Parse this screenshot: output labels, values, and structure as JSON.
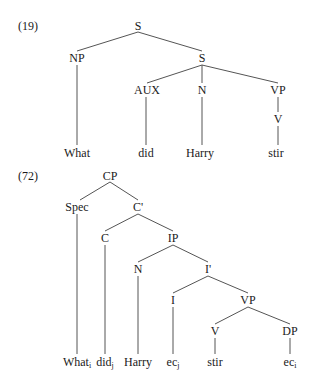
{
  "trees": [
    {
      "number": "(19)",
      "number_pos": [
        18,
        19
      ],
      "nodes": [
        {
          "id": "S1",
          "label": "S",
          "x": 138,
          "y": 26
        },
        {
          "id": "NP",
          "label": "NP",
          "x": 77,
          "y": 58
        },
        {
          "id": "S2",
          "label": "S",
          "x": 202,
          "y": 58
        },
        {
          "id": "AUX",
          "label": "AUX",
          "x": 147,
          "y": 90
        },
        {
          "id": "N",
          "label": "N",
          "x": 202,
          "y": 90
        },
        {
          "id": "VP",
          "label": "VP",
          "x": 278,
          "y": 90
        },
        {
          "id": "V",
          "label": "V",
          "x": 278,
          "y": 119
        },
        {
          "id": "w1",
          "label": "What",
          "x": 77,
          "y": 153
        },
        {
          "id": "w2",
          "label": "did",
          "x": 146,
          "y": 153
        },
        {
          "id": "w3",
          "label": "Harry",
          "x": 200,
          "y": 153
        },
        {
          "id": "w4",
          "label": "stir",
          "x": 276,
          "y": 153
        }
      ],
      "edges": [
        [
          138,
          32,
          77,
          51
        ],
        [
          138,
          32,
          202,
          51
        ],
        [
          77,
          65,
          77,
          145
        ],
        [
          202,
          65,
          147,
          83
        ],
        [
          202,
          65,
          202,
          83
        ],
        [
          202,
          65,
          278,
          83
        ],
        [
          146,
          97,
          146,
          145
        ],
        [
          202,
          97,
          202,
          145
        ],
        [
          278,
          97,
          278,
          112
        ],
        [
          278,
          126,
          278,
          145
        ]
      ]
    },
    {
      "number": "(72)",
      "number_pos": [
        18,
        169
      ],
      "nodes": [
        {
          "id": "CP",
          "label": "CP",
          "x": 110,
          "y": 176
        },
        {
          "id": "Spec",
          "label": "Spec",
          "x": 77,
          "y": 207
        },
        {
          "id": "Cbar",
          "label": "C'",
          "x": 138,
          "y": 207
        },
        {
          "id": "C",
          "label": "C",
          "x": 105,
          "y": 238
        },
        {
          "id": "IP",
          "label": "IP",
          "x": 173,
          "y": 238
        },
        {
          "id": "N2",
          "label": "N",
          "x": 138,
          "y": 269
        },
        {
          "id": "Ibar",
          "label": "I'",
          "x": 208,
          "y": 269
        },
        {
          "id": "I",
          "label": "I",
          "x": 173,
          "y": 300
        },
        {
          "id": "VP2",
          "label": "VP",
          "x": 248,
          "y": 300
        },
        {
          "id": "V2",
          "label": "V",
          "x": 215,
          "y": 331
        },
        {
          "id": "DP",
          "label": "DP",
          "x": 290,
          "y": 331
        },
        {
          "id": "l1",
          "label": "What",
          "sub": "i",
          "x": 77,
          "y": 362
        },
        {
          "id": "l2",
          "label": "did",
          "sub": "j",
          "x": 105,
          "y": 362
        },
        {
          "id": "l3",
          "label": "Harry",
          "x": 138,
          "y": 362
        },
        {
          "id": "l4",
          "label": "ec",
          "sub": "j",
          "x": 173,
          "y": 362
        },
        {
          "id": "l5",
          "label": "stir",
          "x": 215,
          "y": 362
        },
        {
          "id": "l6",
          "label": "ec",
          "sub": "i",
          "x": 290,
          "y": 362
        }
      ],
      "edges": [
        [
          110,
          182,
          80,
          200
        ],
        [
          110,
          182,
          138,
          200
        ],
        [
          77,
          214,
          77,
          354
        ],
        [
          138,
          214,
          105,
          231
        ],
        [
          138,
          214,
          173,
          231
        ],
        [
          105,
          245,
          105,
          354
        ],
        [
          173,
          245,
          138,
          262
        ],
        [
          173,
          245,
          208,
          262
        ],
        [
          138,
          276,
          138,
          354
        ],
        [
          208,
          276,
          173,
          293
        ],
        [
          208,
          276,
          248,
          293
        ],
        [
          173,
          307,
          173,
          354
        ],
        [
          248,
          307,
          215,
          324
        ],
        [
          248,
          307,
          290,
          324
        ],
        [
          215,
          338,
          215,
          354
        ],
        [
          290,
          338,
          290,
          354
        ]
      ]
    }
  ]
}
